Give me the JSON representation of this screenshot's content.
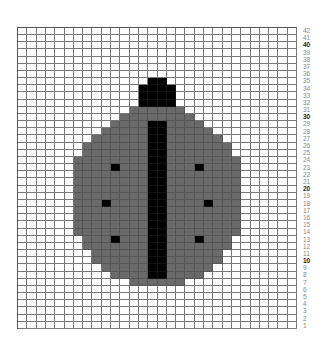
{
  "pattern": {
    "name": "ladybug",
    "columns": 30,
    "rows": 42,
    "colors": {
      "background": "#ffffff",
      "body": "#6a6a6a",
      "detail": "#000000",
      "grid_line": "#777777"
    },
    "row_labels": [
      "42",
      "41",
      "40",
      "39",
      "38",
      "37",
      "36",
      "35",
      "34",
      "33",
      "32",
      "31",
      "30",
      "29",
      "28",
      "27",
      "26",
      "25",
      "24",
      "23",
      "22",
      "21",
      "20",
      "19",
      "18",
      "17",
      "16",
      "15",
      "14",
      "13",
      "12",
      "11",
      "10",
      "9",
      "8",
      "7",
      "6",
      "5",
      "4",
      "3",
      "2",
      "1"
    ],
    "bold_rows": [
      "40",
      "30",
      "20",
      "10"
    ],
    "grey_spans": [
      {
        "row": 31,
        "from": 12,
        "to": 17
      },
      {
        "row": 30,
        "from": 11,
        "to": 18
      },
      {
        "row": 29,
        "from": 10,
        "to": 19
      },
      {
        "row": 28,
        "from": 9,
        "to": 20
      },
      {
        "row": 27,
        "from": 8,
        "to": 21
      },
      {
        "row": 26,
        "from": 7,
        "to": 22
      },
      {
        "row": 25,
        "from": 7,
        "to": 22
      },
      {
        "row": 24,
        "from": 6,
        "to": 23
      },
      {
        "row": 23,
        "from": 6,
        "to": 23
      },
      {
        "row": 22,
        "from": 6,
        "to": 23
      },
      {
        "row": 21,
        "from": 6,
        "to": 23
      },
      {
        "row": 20,
        "from": 6,
        "to": 23
      },
      {
        "row": 19,
        "from": 6,
        "to": 23
      },
      {
        "row": 18,
        "from": 6,
        "to": 23
      },
      {
        "row": 17,
        "from": 6,
        "to": 23
      },
      {
        "row": 16,
        "from": 6,
        "to": 23
      },
      {
        "row": 15,
        "from": 6,
        "to": 23
      },
      {
        "row": 14,
        "from": 6,
        "to": 23
      },
      {
        "row": 13,
        "from": 7,
        "to": 22
      },
      {
        "row": 12,
        "from": 7,
        "to": 22
      },
      {
        "row": 11,
        "from": 8,
        "to": 21
      },
      {
        "row": 10,
        "from": 8,
        "to": 21
      },
      {
        "row": 9,
        "from": 9,
        "to": 20
      },
      {
        "row": 8,
        "from": 10,
        "to": 19
      },
      {
        "row": 7,
        "from": 12,
        "to": 17
      }
    ],
    "black_spans": [
      {
        "row": 35,
        "from": 14,
        "to": 15
      },
      {
        "row": 34,
        "from": 13,
        "to": 16
      },
      {
        "row": 33,
        "from": 13,
        "to": 16
      },
      {
        "row": 32,
        "from": 13,
        "to": 16
      }
    ],
    "stripe": {
      "from_col": 14,
      "to_col": 15,
      "top_row": 29,
      "bottom_row": 8
    },
    "spots": [
      {
        "col": 10,
        "row": 23
      },
      {
        "col": 19,
        "row": 23
      },
      {
        "col": 9,
        "row": 18
      },
      {
        "col": 20,
        "row": 18
      },
      {
        "col": 10,
        "row": 13
      },
      {
        "col": 19,
        "row": 13
      }
    ]
  }
}
